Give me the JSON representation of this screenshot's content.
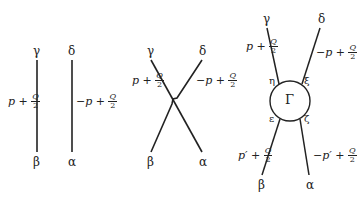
{
  "diagrams": [
    {
      "name": "disconnected",
      "labels": {
        "top_left": "γ",
        "top_right": "δ",
        "bottom_left": "β",
        "bottom_right": "α"
      },
      "momenta": {
        "left": {
          "prefix": "p + ",
          "num": "Q",
          "den": "2"
        },
        "right": {
          "prefix": "−p + ",
          "num": "Q",
          "den": "2"
        }
      }
    },
    {
      "name": "crossed",
      "labels": {
        "top_left": "γ",
        "top_right": "δ",
        "bottom_left": "β",
        "bottom_right": "α"
      },
      "momenta": {
        "left": {
          "prefix": "p + ",
          "num": "Q",
          "den": "2"
        },
        "right": {
          "prefix": "−p + ",
          "num": "Q",
          "den": "2"
        }
      }
    },
    {
      "name": "vertex",
      "labels": {
        "top_left": "γ",
        "top_right": "δ",
        "bottom_left": "β",
        "bottom_right": "α"
      },
      "vertex_label": "Γ",
      "vertex_legs": {
        "upper_left": "η",
        "upper_right": "ξ",
        "lower_left": "ε",
        "lower_right": "ζ"
      },
      "momenta": {
        "upper_left": {
          "prefix": "p + ",
          "num": "Q",
          "den": "2"
        },
        "upper_right": {
          "prefix": "−p + ",
          "num": "Q",
          "den": "2"
        },
        "lower_left": {
          "prefix": "p′ + ",
          "num": "Q",
          "den": "2"
        },
        "lower_right": {
          "prefix": "−p′ + ",
          "num": "Q",
          "den": "2"
        }
      }
    }
  ]
}
